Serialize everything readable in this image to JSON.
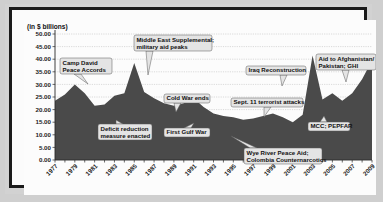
{
  "chart_data": {
    "type": "area",
    "title": "",
    "unit_note": "(in $ billions)",
    "xlabel": "",
    "ylabel": "",
    "ylim": [
      0,
      50
    ],
    "yticks": [
      "0.00",
      "5.00",
      "10.00",
      "15.00",
      "20.00",
      "25.00",
      "30.00",
      "35.00",
      "40.00",
      "45.00",
      "50.00"
    ],
    "grid": true,
    "legend": "none",
    "xtick_labels": [
      "1977",
      "1979",
      "1981",
      "1983",
      "1985",
      "1987",
      "1989",
      "1991",
      "1993",
      "1995",
      "1997",
      "1999",
      "2001",
      "2003",
      "2005",
      "2007",
      "2009"
    ],
    "x": [
      1977,
      1978,
      1979,
      1980,
      1981,
      1982,
      1983,
      1984,
      1985,
      1986,
      1987,
      1988,
      1989,
      1990,
      1991,
      1992,
      1993,
      1994,
      1995,
      1996,
      1997,
      1998,
      1999,
      2000,
      2001,
      2002,
      2003,
      2004,
      2005,
      2006,
      2007,
      2008,
      2009
    ],
    "values": [
      23.5,
      26.0,
      30.0,
      26.5,
      21.5,
      22.0,
      25.5,
      26.5,
      38.5,
      27.0,
      24.5,
      22.5,
      21.5,
      22.5,
      24.5,
      21.0,
      18.5,
      17.5,
      17.0,
      16.0,
      16.5,
      17.5,
      18.5,
      17.0,
      15.0,
      18.0,
      41.5,
      24.0,
      26.5,
      23.5,
      26.5,
      32.0,
      39.5
    ],
    "series_name": "U.S. foreign assistance",
    "annotations": [
      {
        "id": "camp-david",
        "label": "Camp David\nPeace Accords",
        "line1": "Camp David",
        "line2": "Peace Accords",
        "target_year": 1979,
        "target_value": 30.0
      },
      {
        "id": "middle-east-supplemental",
        "label": "Middle East Supplemental;\nmilitary aid peaks",
        "line1": "Middle East Supplemental;",
        "line2": "military aid peaks",
        "target_year": 1985,
        "target_value": 38.5
      },
      {
        "id": "deficit-reduction",
        "label": "Deficit reduction\nmeasure enacted",
        "line1": "Deficit reduction",
        "line2": "measure enacted",
        "target_year": 1985,
        "target_value": 20.0
      },
      {
        "id": "cold-war-ends",
        "label": "Cold War ends",
        "line1": "Cold War ends",
        "line2": "",
        "target_year": 1989,
        "target_value": 21.5
      },
      {
        "id": "first-gulf-war",
        "label": "First Gulf War",
        "line1": "First Gulf War",
        "line2": "",
        "target_year": 1991,
        "target_value": 24.5
      },
      {
        "id": "sept-11",
        "label": "Sept. 11 terrorist attacks",
        "line1": "Sept. 11 terrorist attacks",
        "line2": "",
        "target_year": 2001,
        "target_value": 15.0
      },
      {
        "id": "iraq-reconstruction",
        "label": "Iraq Reconstruction",
        "line1": "Iraq Reconstruction",
        "line2": "",
        "target_year": 2003,
        "target_value": 41.5
      },
      {
        "id": "wye-river",
        "label": "Wye River Peace Aid;\nColombia Counternarcotics",
        "line1": "Wye River Peace Aid;",
        "line2": "Colombia Counternarcotics",
        "target_year": 1999,
        "target_value": 18.5
      },
      {
        "id": "mcc-pepfar",
        "label": "MCC; PEPFAR",
        "line1": "MCC; PEPFAR",
        "line2": "",
        "target_year": 2005,
        "target_value": 26.5
      },
      {
        "id": "aid-afghanistan",
        "label": "Aid to Afghanistan/\nPakistan; GHI",
        "line1": "Aid to Afghanistan/",
        "line2": "Pakistan; GHI",
        "target_year": 2009,
        "target_value": 39.5
      }
    ],
    "colors": {
      "area_fill": "#4a4a4a",
      "gridline": "#b9b9b9",
      "axis": "#2a2a2a",
      "callout_fill": "#e4e4e4",
      "callout_border": "#5a5a5a",
      "plot_background": "#fcfcfc",
      "frame": "#1a1a1a",
      "page_background": "#cfcfcf"
    }
  }
}
